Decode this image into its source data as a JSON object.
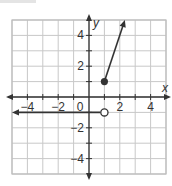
{
  "chart_data": {
    "type": "line",
    "title": "",
    "xlabel": "x",
    "ylabel": "y",
    "xlim": [
      -5,
      5
    ],
    "ylim": [
      -5,
      5
    ],
    "grid": true,
    "x_ticks": [
      -4,
      -2,
      0,
      2,
      4
    ],
    "y_ticks": [
      -4,
      -2,
      2,
      4
    ],
    "x_tick_labels": [
      "−4",
      "−2",
      "0",
      "2",
      "4"
    ],
    "y_tick_labels": [
      "−4",
      "−2",
      "2",
      "4"
    ],
    "series": [
      {
        "name": "ray-upper",
        "description": "y = 3x - 2 for x >= 1",
        "points": [
          [
            1,
            1
          ],
          [
            2.33,
            5
          ]
        ],
        "start_marker": "closed",
        "end_marker": "arrow",
        "color": "#333333"
      },
      {
        "name": "ray-lower",
        "description": "y = -1 for x < 1",
        "points": [
          [
            1,
            -1
          ],
          [
            -5,
            -1
          ]
        ],
        "start_marker": "open",
        "end_marker": "arrow",
        "color": "#333333"
      }
    ],
    "colors": {
      "grid": "#c8c8c8",
      "axis": "#333333",
      "frame": "#bdbdbd"
    }
  }
}
